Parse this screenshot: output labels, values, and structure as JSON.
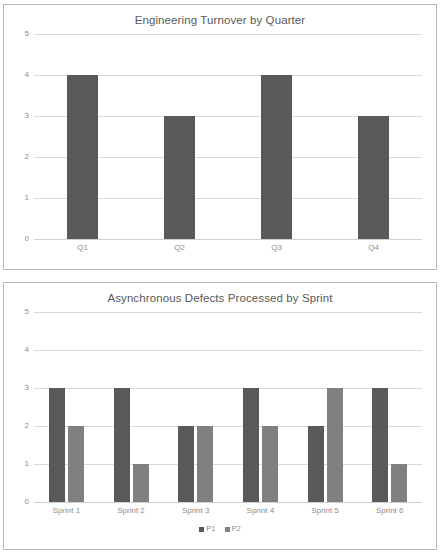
{
  "colors": {
    "series_p1": "#595959",
    "series_q": "#595959",
    "series_p2": "#808080",
    "gridline": "#d9d9d9",
    "axis_text": "#8c8c8c",
    "title_text": "#595959",
    "panel_border": "#b8b8b8",
    "background": "#ffffff"
  },
  "charts": [
    {
      "panel_name": "turnover-chart-panel",
      "chart_data": {
        "type": "bar",
        "title": "Engineering Turnover by Quarter",
        "xlabel": "",
        "ylabel": "",
        "categories": [
          "Q1",
          "Q2",
          "Q3",
          "Q4"
        ],
        "values": [
          4,
          3,
          4,
          3
        ],
        "yticks": [
          5,
          4,
          3,
          2,
          1,
          0
        ],
        "ylim": [
          0,
          5
        ],
        "grid": true,
        "legend": false,
        "legend_position": "none"
      }
    },
    {
      "panel_name": "defects-chart-panel",
      "chart_data": {
        "type": "bar",
        "title": "Asynchronous Defects Processed by Sprint",
        "xlabel": "",
        "ylabel": "",
        "categories": [
          "Sprint 1",
          "Sprint 2",
          "Sprint 3",
          "Sprint 4",
          "Sprint 5",
          "Sprint 6"
        ],
        "series": [
          {
            "name": "P1",
            "values": [
              3,
              3,
              2,
              3,
              2,
              3
            ]
          },
          {
            "name": "P2",
            "values": [
              2,
              1,
              2,
              2,
              3,
              1
            ]
          }
        ],
        "yticks": [
          5,
          4,
          3,
          2,
          1,
          0
        ],
        "ylim": [
          0,
          5
        ],
        "grid": true,
        "legend": true,
        "legend_position": "bottom"
      }
    }
  ]
}
